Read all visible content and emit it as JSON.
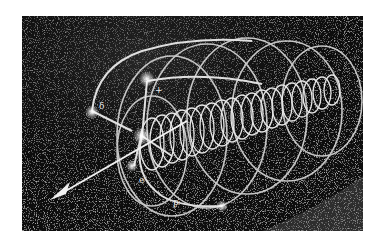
{
  "figure": {
    "background_color": "#0c0c0c",
    "track_color": "#dcdcdc",
    "page_color": "#ffffff",
    "labels": [
      {
        "id": "delta",
        "text": "δ"
      },
      {
        "id": "plus",
        "text": "+"
      },
      {
        "id": "e",
        "text": "e"
      },
      {
        "id": "p",
        "text": "p"
      }
    ]
  }
}
